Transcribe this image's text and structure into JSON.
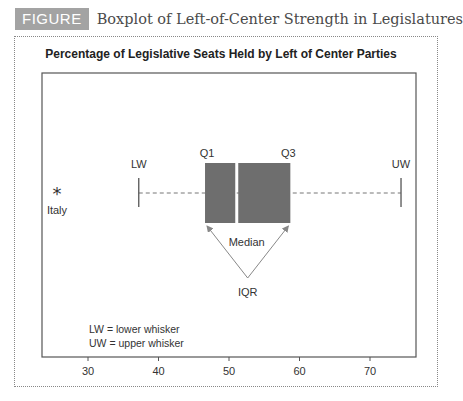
{
  "figure": {
    "badge": "FIGURE 11-9",
    "title": "Boxplot of Left-of-Center Strength in Legislatures"
  },
  "chart_data": {
    "type": "boxplot",
    "title": "Percentage of Legislative Seats Held by Left of Center Parties",
    "xlabel": "",
    "ylabel": "",
    "xlim": [
      23.5,
      76.5
    ],
    "x_ticks": [
      30,
      40,
      50,
      60,
      70
    ],
    "x_tick_labels": [
      "30",
      "40",
      "50",
      "60",
      "70"
    ],
    "grid": false,
    "orientation": "horizontal",
    "stats": {
      "lower_whisker": 37.2,
      "q1": 46.6,
      "median": 51.1,
      "q3": 58.7,
      "upper_whisker": 74.4
    },
    "outliers": [
      {
        "label": "Italy",
        "value": 25.6,
        "marker": "*"
      }
    ],
    "annotations": {
      "lw": "LW",
      "q1": "Q1",
      "q3": "Q3",
      "uw": "UW",
      "median": "Median",
      "iqr": "IQR"
    },
    "legend": [
      "LW = lower whisker",
      "UW = upper whisker"
    ],
    "colors": {
      "box": "#6e6e6e",
      "frame": "#555555",
      "whisker": "#777777"
    }
  }
}
